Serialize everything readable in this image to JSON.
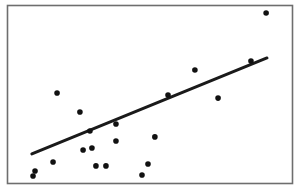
{
  "chart_data": {
    "type": "scatter",
    "title": "",
    "xlabel": "",
    "ylabel": "",
    "xlim": [
      0,
      10
    ],
    "ylim": [
      0,
      10
    ],
    "grid": false,
    "legend": null,
    "axes_ticks": "none",
    "points": [
      {
        "x": 0.91,
        "y": 0.45
      },
      {
        "x": 0.98,
        "y": 0.73
      },
      {
        "x": 1.61,
        "y": 1.23
      },
      {
        "x": 1.75,
        "y": 5.08
      },
      {
        "x": 2.55,
        "y": 4.02
      },
      {
        "x": 2.66,
        "y": 1.9
      },
      {
        "x": 2.97,
        "y": 2.01
      },
      {
        "x": 2.9,
        "y": 2.96
      },
      {
        "x": 3.11,
        "y": 1.01
      },
      {
        "x": 3.46,
        "y": 1.01
      },
      {
        "x": 3.81,
        "y": 3.35
      },
      {
        "x": 3.81,
        "y": 2.4
      },
      {
        "x": 5.17,
        "y": 2.63
      },
      {
        "x": 4.72,
        "y": 0.5
      },
      {
        "x": 4.93,
        "y": 1.12
      },
      {
        "x": 5.63,
        "y": 4.97
      },
      {
        "x": 6.57,
        "y": 6.37
      },
      {
        "x": 7.38,
        "y": 4.8
      },
      {
        "x": 8.53,
        "y": 6.87
      },
      {
        "x": 9.06,
        "y": 9.55
      }
    ],
    "trendline": {
      "type": "linear",
      "from": {
        "x": 0.87,
        "y": 1.68
      },
      "to": {
        "x": 9.09,
        "y": 7.04
      }
    },
    "colors": {
      "points": "#111111",
      "trendline": "#1a1a1a",
      "frame": "#6e6e6e",
      "background": "#ffffff"
    }
  }
}
